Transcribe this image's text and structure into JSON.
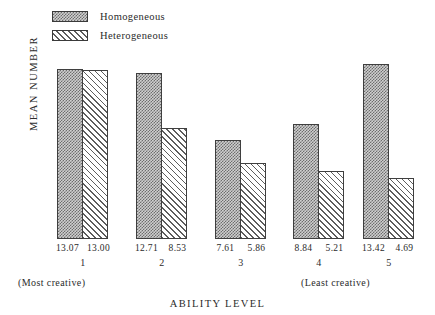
{
  "chart_data": {
    "type": "bar",
    "title": "",
    "subtitle": "",
    "xlabel": "ABILITY LEVEL",
    "ylabel": "MEAN NUMBER",
    "categories": [
      "1",
      "2",
      "3",
      "4",
      "5"
    ],
    "series": [
      {
        "name": "Homogeneous",
        "pattern": "dotted",
        "values": [
          13.07,
          12.71,
          7.61,
          8.84,
          13.42
        ]
      },
      {
        "name": "Heterogeneous",
        "pattern": "diagonal-hatch",
        "values": [
          13.0,
          8.53,
          5.86,
          5.21,
          4.69
        ]
      }
    ],
    "value_labels": [
      [
        "13.07",
        "13.00"
      ],
      [
        "12.71",
        "8.53"
      ],
      [
        "7.61",
        "5.86"
      ],
      [
        "8.84",
        "5.21"
      ],
      [
        "13.42",
        "4.69"
      ]
    ],
    "annotations": [
      {
        "text": "(Most creative)",
        "position": "below-category-1"
      },
      {
        "text": "(Least creative)",
        "position": "below-category-5"
      }
    ],
    "ylim": [
      0,
      14.5
    ],
    "grid": false,
    "axis_ticks_visible": false,
    "legend": {
      "position": "top-left",
      "entries": [
        {
          "label": "Homogeneous",
          "pattern": "dotted"
        },
        {
          "label": "Heterogeneous",
          "pattern": "diagonal-hatch"
        }
      ]
    },
    "colors": {
      "homogeneous_fill": "#cfcfcf",
      "homogeneous_stipple": "#6d6d6d",
      "heterogeneous_fill": "#ffffff",
      "heterogeneous_hatch": "#5d5d5d",
      "bar_outline": "#3f3f3f",
      "text": "#2b2b2b",
      "background": "#ffffff"
    }
  }
}
